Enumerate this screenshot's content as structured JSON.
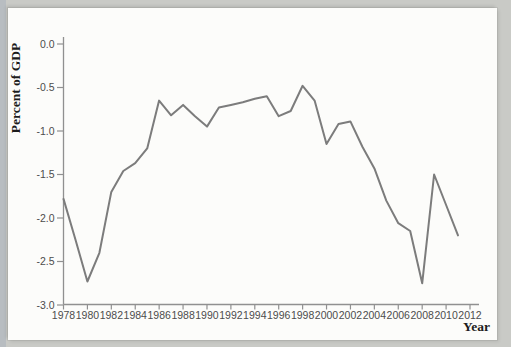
{
  "page": {
    "background_color": "#c9cac6",
    "panel_color": "#fcfcfa"
  },
  "chart_data": {
    "type": "line",
    "xlabel": "Year",
    "ylabel": "Percent of GDP",
    "x": [
      1978,
      1979,
      1980,
      1981,
      1982,
      1983,
      1984,
      1985,
      1986,
      1987,
      1988,
      1989,
      1990,
      1991,
      1992,
      1993,
      1994,
      1995,
      1996,
      1997,
      1998,
      1999,
      2000,
      2001,
      2002,
      2003,
      2004,
      2005,
      2006,
      2007,
      2008,
      2009,
      2010,
      2011
    ],
    "values": [
      -1.78,
      -2.25,
      -2.73,
      -2.4,
      -1.7,
      -1.46,
      -1.37,
      -1.2,
      -0.65,
      -0.82,
      -0.7,
      -0.83,
      -0.95,
      -0.73,
      -0.7,
      -0.67,
      -0.63,
      -0.6,
      -0.83,
      -0.77,
      -0.48,
      -0.65,
      -1.15,
      -0.92,
      -0.89,
      -1.18,
      -1.43,
      -1.8,
      -2.06,
      -2.15,
      -2.75,
      -1.5,
      -1.85,
      -2.2
    ],
    "xlim": [
      1978,
      2012
    ],
    "ylim": [
      -3.0,
      0.0
    ],
    "x_ticks": [
      1978,
      1980,
      1982,
      1984,
      1986,
      1988,
      1990,
      1992,
      1994,
      1996,
      1998,
      2000,
      2002,
      2004,
      2006,
      2008,
      2010,
      2012
    ],
    "x_tick_labels": [
      "1978",
      "1980",
      "1982",
      "1984",
      "1986",
      "1988",
      "1990",
      "1992",
      "1994",
      "1996",
      "1998",
      "2000",
      "2002",
      "2004",
      "2006",
      "2008",
      "2010",
      "2012"
    ],
    "y_ticks": [
      0.0,
      -0.5,
      -1.0,
      -1.5,
      -2.0,
      -2.5,
      -3.0
    ],
    "y_tick_labels": [
      "0.0",
      "-0.5",
      "-1.0",
      "-1.5",
      "-2.0",
      "-2.5",
      "-3.0"
    ],
    "grid": false,
    "legend": "none",
    "line_color": "#7c7c7c",
    "axis_color": "#909090",
    "tick_text_color": "#4c4c4c"
  }
}
